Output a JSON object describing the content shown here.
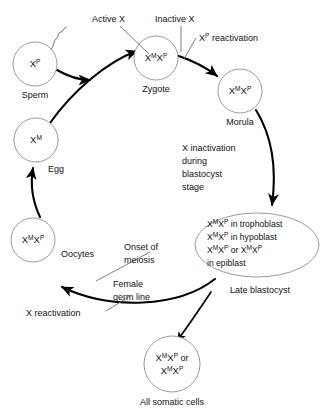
{
  "diagram": {
    "background_color": "#ffffff",
    "outline_color": "#9a9a9a",
    "arrow_color": "#000000",
    "leader_color": "#6f6f6f"
  },
  "cells": {
    "sperm": {
      "label": "Sperm",
      "genotype_base": "X",
      "genotype_sup": "P",
      "icon": "sperm-cell-with-flagellum"
    },
    "zygote": {
      "label": "Zygote",
      "maternal_base": "X",
      "maternal_sup": "M",
      "paternal_base": "X",
      "paternal_sup": "P"
    },
    "morula": {
      "label": "Morula",
      "maternal_base": "X",
      "maternal_sup": "M",
      "paternal_base": "X",
      "paternal_sup": "P"
    },
    "egg": {
      "label": "Egg",
      "genotype_base": "X",
      "genotype_sup": "M"
    },
    "oocytes": {
      "label": "Oocytes",
      "maternal_base": "X",
      "maternal_sup": "M",
      "paternal_base": "X",
      "paternal_sup": "P"
    },
    "somatic": {
      "label": "All somatic cells",
      "line1_a_base": "X",
      "line1_a_sup": "M",
      "line1_b_base": "X",
      "line1_b_sup": "P",
      "line1_conjunction": "or",
      "line2_a_base": "X",
      "line2_a_sup": "M",
      "line2_b_base": "X",
      "line2_b_sup": "P"
    },
    "late_blastocyst": {
      "label": "Late blastocyst",
      "lines": [
        {
          "a_base": "X",
          "a_sup": "M",
          "b_base": "X",
          "b_sup": "P",
          "tail": " in trophoblast"
        },
        {
          "a_base": "X",
          "a_sup": "M",
          "b_base": "X",
          "b_sup": "P",
          "tail": " in hypoblast"
        },
        {
          "a_base": "X",
          "a_sup": "M",
          "b_base": "X",
          "b_sup": "P",
          "conjunction": " or ",
          "c_base": "X",
          "c_sup": "M",
          "d_base": "X",
          "d_sup": "P"
        },
        {
          "tail": "in epiblast"
        }
      ]
    }
  },
  "annotations": {
    "active_x": "Active X",
    "inactive_x": "Inactive X",
    "xp_reactivation_base": "X",
    "xp_reactivation_sup": "P",
    "xp_reactivation_tail": " reactivation",
    "x_inactivation": [
      "X inactivation",
      "during",
      "blastocyst",
      "stage"
    ],
    "onset_of_meiosis": [
      "Onset of",
      "meiosis"
    ],
    "female_germ_line": [
      "Female",
      "germ line"
    ],
    "x_reactivation": "X reactivation"
  }
}
